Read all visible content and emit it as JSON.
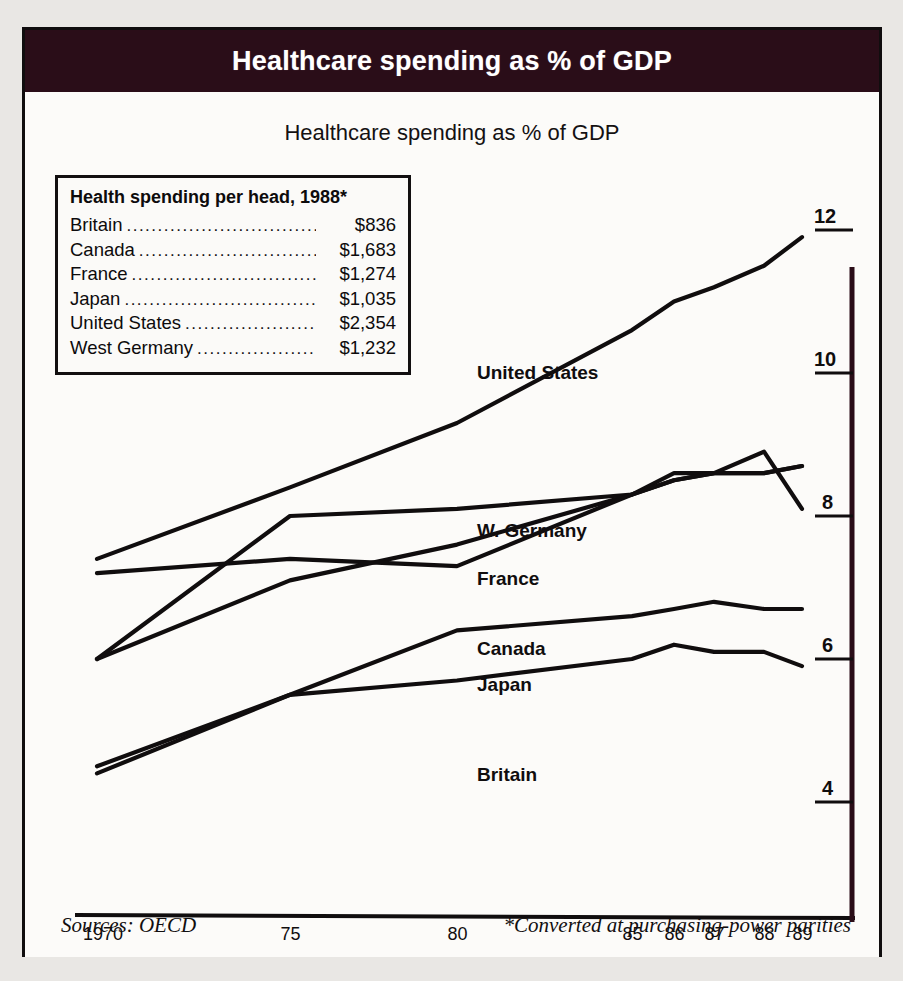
{
  "header": {
    "title": "Healthcare spending as % of GDP"
  },
  "chart_card": {
    "subtitle": "Healthcare spending as % of GDP"
  },
  "legend_box": {
    "title": "Health spending per head, 1988*",
    "dots": "..............................................................",
    "rows": [
      {
        "name": "Britain",
        "value": "$836"
      },
      {
        "name": "Canada",
        "value": "$1,683"
      },
      {
        "name": "France",
        "value": "$1,274"
      },
      {
        "name": "Japan",
        "value": "$1,035"
      },
      {
        "name": "United States",
        "value": "$2,354"
      },
      {
        "name": "West Germany",
        "value": "$1,232"
      }
    ]
  },
  "series_labels": [
    {
      "text": "United States",
      "x": 452,
      "y": 270
    },
    {
      "text": "W. Germany",
      "x": 452,
      "y": 428
    },
    {
      "text": "France",
      "x": 452,
      "y": 476
    },
    {
      "text": "Canada",
      "x": 452,
      "y": 546
    },
    {
      "text": "Japan",
      "x": 452,
      "y": 582
    },
    {
      "text": "Britain",
      "x": 452,
      "y": 672
    }
  ],
  "footer": {
    "source": "Sources: OECD",
    "note": "*Converted at purchasing-power parities"
  },
  "colors": {
    "banner": "#2a0d18",
    "ink": "#100d0e",
    "paper": "#fcfbf9",
    "scan": "#e9e7e4"
  },
  "chart_data": {
    "type": "line",
    "title": "Healthcare spending as % of GDP",
    "xlabel": "",
    "ylabel": "% of GDP",
    "xlim": [
      1970,
      1989
    ],
    "ylim": [
      3.6,
      12.3
    ],
    "yticks": [
      12,
      10,
      8,
      6,
      4
    ],
    "xticks": [
      1970,
      1975,
      1980,
      1985,
      1986,
      1987,
      1988,
      1989
    ],
    "xtick_labels": [
      "1970",
      "75",
      "80",
      "85",
      "86",
      "87",
      "88",
      "89"
    ],
    "grid": false,
    "legend_position": "inline-labels",
    "x": [
      1970,
      1975,
      1980,
      1985,
      1986,
      1987,
      1988,
      1989
    ],
    "series": [
      {
        "name": "United States",
        "values": [
          7.4,
          8.4,
          9.3,
          10.6,
          11.0,
          11.2,
          11.5,
          11.9
        ]
      },
      {
        "name": "W. Germany",
        "values": [
          6.0,
          8.0,
          8.1,
          8.3,
          8.6,
          8.6,
          8.6,
          8.7
        ]
      },
      {
        "name": "France",
        "values": [
          6.0,
          7.1,
          7.6,
          8.3,
          8.5,
          8.6,
          8.9,
          8.1
        ]
      },
      {
        "name": "Canada",
        "values": [
          7.2,
          7.4,
          7.3,
          8.3,
          8.5,
          8.6,
          8.6,
          8.7
        ]
      },
      {
        "name": "Japan",
        "values": [
          4.4,
          5.5,
          6.4,
          6.6,
          6.7,
          6.8,
          6.7,
          6.7
        ]
      },
      {
        "name": "Britain",
        "values": [
          4.5,
          5.5,
          5.7,
          6.0,
          6.2,
          6.1,
          6.1,
          5.9
        ]
      }
    ]
  }
}
